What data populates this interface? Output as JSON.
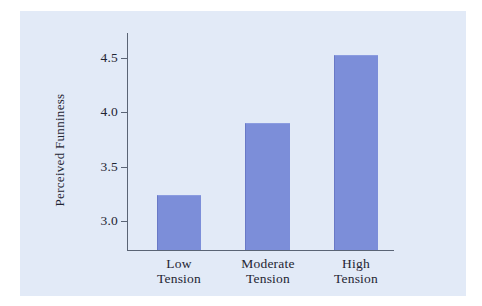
{
  "chart_data": {
    "type": "bar",
    "title": "",
    "subtitle": "",
    "xlabel": "",
    "ylabel": "Perceived Funniness",
    "categories": [
      "Low Tension",
      "Moderate Tension",
      "High Tension"
    ],
    "category_lines": [
      [
        "Low",
        "Tension"
      ],
      [
        "Moderate",
        "Tension"
      ],
      [
        "High",
        "Tension"
      ]
    ],
    "values": [
      3.24,
      3.9,
      4.53
    ],
    "ylim": [
      2.75,
      4.72
    ],
    "yticks": [
      3.0,
      3.5,
      4.0,
      4.5
    ],
    "ytick_labels": [
      "3.0",
      "3.5",
      "4.0",
      "4.5"
    ],
    "grid": false,
    "legend": false,
    "legend_position": "none",
    "bar_color": "#7c8ed9",
    "panel_background": "#e2eaf7",
    "axis_color": "#5a6475",
    "text_color": "#1f2533"
  }
}
